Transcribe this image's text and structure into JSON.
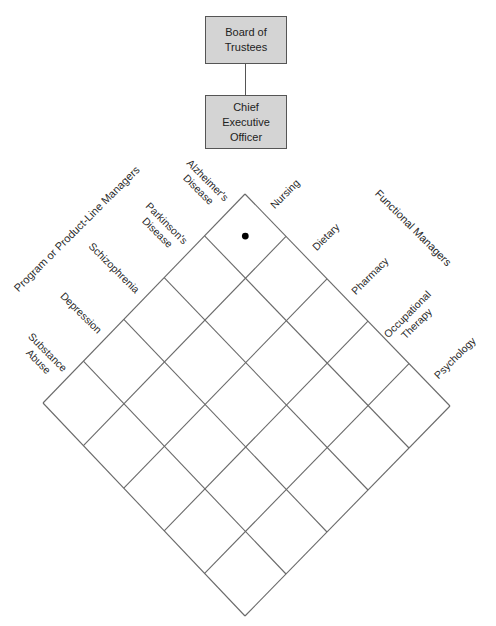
{
  "org_chart": {
    "board": {
      "line1": "Board of",
      "line2": "Trustees"
    },
    "ceo": {
      "line1": "Chief",
      "line2": "Executive",
      "line3": "Officer"
    }
  },
  "matrix": {
    "row_group_label": "Program or Product-Line Managers",
    "column_group_label": "Functional Managers",
    "rows": [
      {
        "line1": "Alzheimer's",
        "line2": "Disease"
      },
      {
        "line1": "Parkinson's",
        "line2": "Disease"
      },
      {
        "line1": "Schizophrenia",
        "line2": ""
      },
      {
        "line1": "Depression",
        "line2": ""
      },
      {
        "line1": "Substance",
        "line2": "Abuse"
      }
    ],
    "columns": [
      {
        "line1": "Nursing",
        "line2": ""
      },
      {
        "line1": "Dietary",
        "line2": ""
      },
      {
        "line1": "Pharmacy",
        "line2": ""
      },
      {
        "line1": "Occupational",
        "line2": "Therapy"
      },
      {
        "line1": "Psychology",
        "line2": ""
      }
    ],
    "grid_size": 5,
    "marked_cell": {
      "row": 0,
      "column": 0,
      "row_label": "Alzheimer's Disease",
      "column_label": "Nursing"
    },
    "colors": {
      "box_fill": "#d4d4d4",
      "box_border": "#555555",
      "grid_line": "#6a6a6a",
      "marker": "#000000"
    }
  }
}
